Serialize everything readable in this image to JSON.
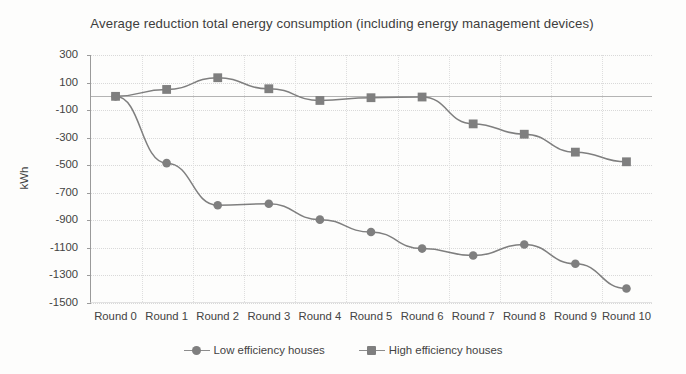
{
  "chart_data": {
    "type": "line",
    "title": "Average reduction total energy consumption (including energy management devices)",
    "xlabel": "",
    "ylabel": "kWh",
    "categories": [
      "Round 0",
      "Round 1",
      "Round 2",
      "Round 3",
      "Round 4",
      "Round 5",
      "Round 6",
      "Round 7",
      "Round 8",
      "Round 9",
      "Round 10"
    ],
    "ylim": [
      -1500,
      300
    ],
    "ytick_labels": [
      "300",
      "100",
      "-100",
      "-300",
      "-500",
      "-700",
      "-900",
      "-1100",
      "-1300",
      "-1500"
    ],
    "ytick_values": [
      300,
      100,
      -100,
      -300,
      -500,
      -700,
      -900,
      -1100,
      -1300,
      -1500
    ],
    "ytick_step": 200,
    "grid": "horizontal-and-vertical-dotted",
    "legend_position": "bottom-center",
    "series": [
      {
        "name": "Low efficiency houses",
        "marker": "circle",
        "color": "#7f7f7f",
        "values": [
          0,
          -485,
          -790,
          -780,
          -895,
          -985,
          -1105,
          -1155,
          -1075,
          -1215,
          -1395
        ]
      },
      {
        "name": "High efficiency houses",
        "marker": "square",
        "color": "#7f7f7f",
        "values": [
          0,
          50,
          135,
          55,
          -30,
          -10,
          -5,
          -200,
          -275,
          -405,
          -475
        ]
      }
    ]
  },
  "legend": {
    "entries": [
      {
        "label": "Low efficiency houses",
        "marker": "circle"
      },
      {
        "label": "High efficiency houses",
        "marker": "square"
      }
    ]
  }
}
